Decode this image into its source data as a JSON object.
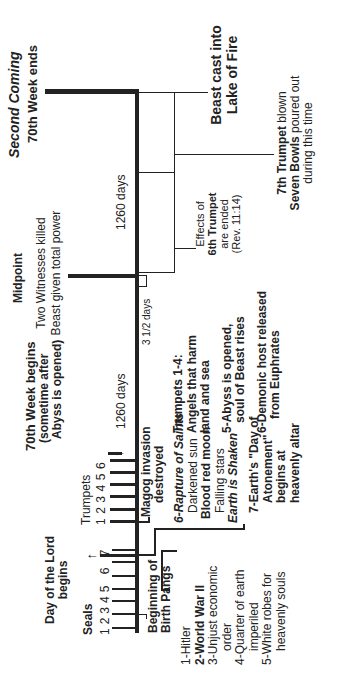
{
  "seals": {
    "label": "Seals",
    "numbers": [
      "1",
      "2",
      "3",
      "4",
      "5",
      "6",
      "7"
    ]
  },
  "trumpets": {
    "label": "Trumpets",
    "numbers": [
      "1",
      "2",
      "3",
      "4",
      "5",
      "6"
    ]
  },
  "day_of_lord": {
    "line1": "Day of the Lord",
    "line2": "begins"
  },
  "week_begins": {
    "line1": "70th Week begins",
    "line2": "(sometime after",
    "line3": "Abyss is opened)"
  },
  "midpoint": {
    "title": "Midpoint",
    "line1": "Two Witnesses killed",
    "line2": "Beast given total power"
  },
  "second_coming": {
    "line1": "Second Coming",
    "line2": "70th Week ends"
  },
  "durations": {
    "first": "1260 days",
    "second": "1260 days",
    "short": "3 1/2 days"
  },
  "birth_pangs": {
    "line1": "Beginning of",
    "line2": "Birth Pangs"
  },
  "seal_events": [
    "1-Hitler",
    "2-World War II",
    "3-Unjust economic",
    "order",
    "4-Quarter of earth",
    "imperiled",
    "5-White robes for",
    "heavenly souls"
  ],
  "magog": {
    "line1": "Magog invasion",
    "line2": "destroyed"
  },
  "sixth_seal": {
    "line1": "6-Rapture of Saints",
    "line2": "Darkened sun",
    "line3": "Blood red moon",
    "line4": "Falling stars",
    "line5": "Earth is Shaken"
  },
  "seventh_seal": {
    "line1": "7-Earth's \"Day of",
    "line2": "Atonement\"",
    "line3": "begins at",
    "line4": "heavenly altar"
  },
  "trumpet_events": {
    "t14a": "Trumpets 1-4:",
    "t14b": "Angels that harm",
    "t14c": "land and sea",
    "t5a": "5-Abyss is opened,",
    "t5b": "soul of Beast rises",
    "t6a": "6-Demonic host released",
    "t6b": "from Euphrates"
  },
  "sixth_trumpet_end": {
    "line1": "Effects of",
    "line2": "6th Trumpet",
    "line3": "are ended",
    "line4": "(Rev. 11:14)"
  },
  "seventh_trumpet": {
    "line1a": "7th Trumpet",
    "line1b": " blown",
    "line2a": "Seven Bowls",
    "line2b": " poured out",
    "line3": "during this time"
  },
  "beast": {
    "line1": "Beast cast into",
    "line2": "Lake of Fire"
  }
}
